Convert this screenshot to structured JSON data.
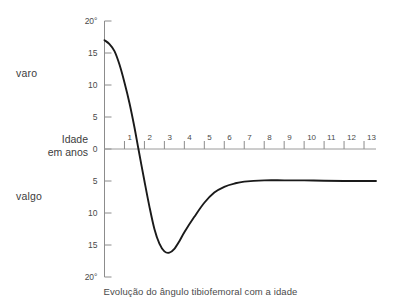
{
  "chart_data": {
    "type": "line",
    "title": "",
    "caption": "Evolução do ângulo tibiofemoral com a idade",
    "xlabel": "Idade",
    "xlabel_line2": "em anos",
    "ylabel_top": "varo",
    "ylabel_bottom": "valgo",
    "x": [
      0,
      0.25,
      0.5,
      0.75,
      1.0,
      1.25,
      1.5,
      1.7,
      2.0,
      2.25,
      2.5,
      2.75,
      3.0,
      3.25,
      3.5,
      3.75,
      4.0,
      4.5,
      5.0,
      5.5,
      6.0,
      6.5,
      7.0,
      8.0,
      9.0,
      10.0,
      11.0,
      12.0,
      13.0,
      13.6
    ],
    "values": [
      17,
      16.4,
      15.3,
      13.2,
      10.4,
      7.2,
      3.4,
      0,
      -5.0,
      -9.0,
      -12.5,
      -14.8,
      -16.0,
      -16.2,
      -15.6,
      -14.4,
      -13.0,
      -10.6,
      -8.4,
      -6.8,
      -5.9,
      -5.4,
      -5.1,
      -4.9,
      -4.9,
      -4.9,
      -4.95,
      -5.0,
      -5.0,
      -5.0
    ],
    "xlim": [
      0,
      13.6
    ],
    "ylim": [
      -20,
      20
    ],
    "xticks": [
      1,
      2,
      3,
      4,
      5,
      6,
      7,
      8,
      9,
      10,
      11,
      12,
      13
    ],
    "xtick_labels": [
      "1",
      "2",
      "3",
      "4",
      "5",
      "6",
      "7",
      "8",
      "9",
      "10",
      "11",
      "12",
      "13"
    ],
    "yticks": [
      20,
      15,
      10,
      5,
      0,
      -5,
      -10,
      -15,
      -20
    ],
    "ytick_labels": [
      "20°",
      "15",
      "10",
      "5",
      "0",
      "5",
      "10",
      "15",
      "20°"
    ],
    "grid": false,
    "legend": false,
    "line_color": "#1a1a1a",
    "axis_color": "#8c8c8c",
    "zero_line_color": "#9a9a9a",
    "annotations": {
      "peak_varus_deg": 17,
      "zero_crossing_age": 1.7,
      "max_valgus_deg": 16.2,
      "max_valgus_age": 3.25,
      "plateau_valgus_deg": 5
    }
  }
}
